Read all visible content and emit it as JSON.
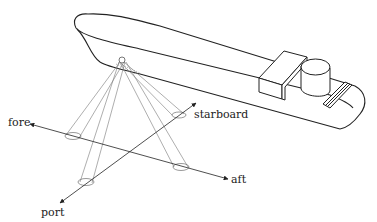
{
  "diagram": {
    "labels": {
      "fore": "fore",
      "aft": "aft",
      "port": "port",
      "starboard": "starboard"
    },
    "colors": {
      "line": "#222222",
      "beam": "#777777",
      "background": "#ffffff"
    },
    "beam_count": 4
  }
}
